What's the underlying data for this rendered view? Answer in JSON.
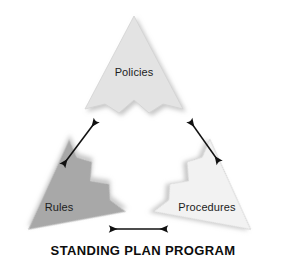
{
  "diagram": {
    "caption": "STANDING PLAN PROGRAM",
    "background_color": "#ffffff",
    "nodes": [
      {
        "id": "policies",
        "label": "Policies",
        "icon": "arrowhead-up-shape",
        "fill_color": "#e3e3e3",
        "position": "top"
      },
      {
        "id": "rules",
        "label": "Rules",
        "icon": "arrowhead-rotated-shape",
        "fill_color": "#a8a8a8",
        "position": "bottom-left"
      },
      {
        "id": "procedures",
        "label": "Procedures",
        "icon": "arrowhead-rotated-shape",
        "fill_color": "#f2f2f2",
        "position": "bottom-right"
      }
    ],
    "connectors": [
      {
        "id": "policies-rules",
        "icon": "double-headed-arrow-icon",
        "from": "policies",
        "to": "rules",
        "color": "#111111"
      },
      {
        "id": "policies-procedures",
        "icon": "double-headed-arrow-icon",
        "from": "policies",
        "to": "procedures",
        "color": "#111111"
      },
      {
        "id": "rules-procedures",
        "icon": "double-headed-arrow-icon",
        "from": "rules",
        "to": "procedures",
        "color": "#111111"
      }
    ]
  }
}
